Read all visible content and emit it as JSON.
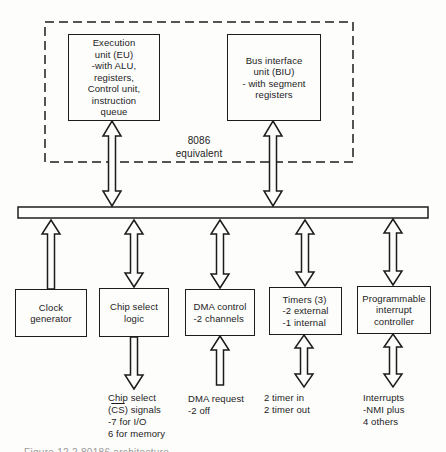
{
  "ink_color": "#1c1c1c",
  "background_color": "#fdfdfb",
  "group": {
    "label": "8086\nequivalent"
  },
  "boxes": {
    "eu": "Execution\nunit (EU)\n-with ALU,\nregisters,\nControl unit,\ninstruction\nqueue",
    "biu": "Bus interface\nunit (BIU)\n- with segment\nregisters",
    "clock": "Clock\ngenerator",
    "chip_select": "Chip select\nlogic",
    "dma": "DMA control\n-2 channels",
    "timers": "Timers (3)\n-2 external\n-1 internal",
    "pic": "Programmable\ninterrupt\ncontroller"
  },
  "labels": {
    "chip_select": {
      "pre": "Chip select\n(",
      "overline": "CS",
      "post": ") signals\n-7 for I/O\n6 for memory"
    },
    "dma": "DMA request\n-2 off",
    "timers": "2 timer in\n2 timer out",
    "interrupts": "Interrupts\n-NMI plus\n4 others"
  },
  "caption": "Figure 12.2   80186 architecture"
}
